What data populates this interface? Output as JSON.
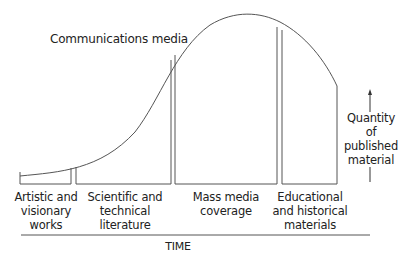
{
  "diagram": {
    "curve_label": "Communications media",
    "y_axis_label": [
      "Quantity",
      "of",
      "published",
      "material"
    ],
    "x_axis_label": "TIME",
    "stages": [
      {
        "lines": [
          "Artistic and",
          "visionary",
          "works"
        ]
      },
      {
        "lines": [
          "Scientific and",
          "technical",
          "literature"
        ]
      },
      {
        "lines": [
          "Mass media",
          "coverage"
        ]
      },
      {
        "lines": [
          "Educational",
          "and historical",
          "materials"
        ]
      }
    ],
    "colors": {
      "line": "#555555",
      "text": "#222222",
      "background": "#ffffff"
    }
  }
}
